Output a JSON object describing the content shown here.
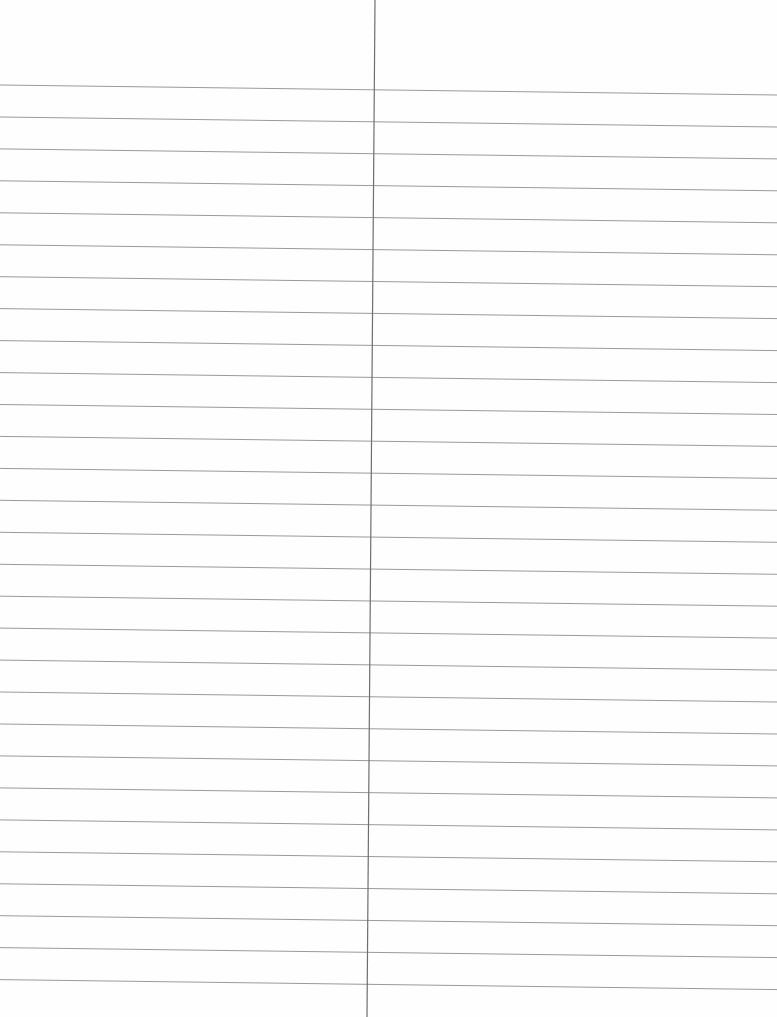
{
  "document": {
    "type": "lined-notebook-page",
    "content_text": "",
    "paper_color": "#fefefe",
    "rule_color": "#9a9a9a",
    "divider_color": "#6e6e6e"
  },
  "rules": {
    "count": 29,
    "first_y_left": 85,
    "spacing": 31.95,
    "tilt_px": 10
  },
  "divider": {
    "x_top": 375,
    "x_bottom": 367
  }
}
